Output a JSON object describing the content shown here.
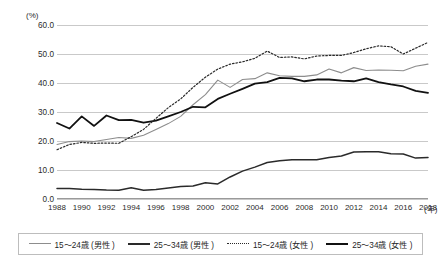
{
  "chart_data": {
    "type": "line",
    "title": "",
    "xlabel": "(年)",
    "ylabel": "(%)",
    "ylim": [
      0.0,
      60.0
    ],
    "yticks": [
      "0.0",
      "10.0",
      "20.0",
      "30.0",
      "40.0",
      "50.0",
      "60.0"
    ],
    "ytick_values": [
      0.0,
      10.0,
      20.0,
      30.0,
      40.0,
      50.0,
      60.0
    ],
    "grid": true,
    "legend_position": "bottom",
    "x": [
      1988,
      1989,
      1990,
      1991,
      1992,
      1993,
      1994,
      1995,
      1996,
      1997,
      1998,
      1999,
      2000,
      2001,
      2002,
      2003,
      2004,
      2005,
      2006,
      2007,
      2008,
      2009,
      2010,
      2011,
      2012,
      2013,
      2014,
      2015,
      2016,
      2017,
      2018
    ],
    "xtick_labels": [
      "1988",
      "1990",
      "1992",
      "1994",
      "1996",
      "1998",
      "2000",
      "2002",
      "2004",
      "2006",
      "2008",
      "2010",
      "2012",
      "2014",
      "2016",
      "2018"
    ],
    "xtick_values": [
      1988,
      1990,
      1992,
      1994,
      1996,
      1998,
      2000,
      2002,
      2004,
      2006,
      2008,
      2010,
      2012,
      2014,
      2016,
      2018
    ],
    "series": [
      {
        "name": "15～24歳 (男性 )",
        "style": "solid-thin-gray",
        "color": "#8d8d8d",
        "values": [
          18.8,
          19.8,
          20.0,
          19.8,
          20.5,
          21.2,
          20.9,
          22.0,
          24.0,
          26.0,
          28.5,
          32.5,
          36.0,
          41.0,
          38.5,
          41.2,
          41.5,
          43.5,
          42.5,
          42.3,
          42.3,
          42.8,
          44.8,
          43.5,
          45.3,
          44.3,
          44.5,
          44.4,
          44.2,
          45.8,
          46.5
        ]
      },
      {
        "name": "25～34歳 (男性 )",
        "style": "solid-thick-dark",
        "color": "#2a2a2a",
        "values": [
          3.6,
          3.6,
          3.4,
          3.3,
          3.1,
          3.0,
          3.9,
          3.0,
          3.3,
          3.8,
          4.3,
          4.5,
          5.6,
          5.2,
          7.6,
          9.6,
          11.0,
          12.6,
          13.2,
          13.5,
          13.5,
          13.5,
          14.3,
          14.8,
          16.2,
          16.3,
          16.3,
          15.6,
          15.5,
          14.1,
          14.3
        ]
      },
      {
        "name": "15～24歳 (女性 )",
        "style": "dotted-dark",
        "color": "#2a2a2a",
        "values": [
          17.0,
          18.8,
          19.5,
          19.2,
          19.3,
          19.2,
          21.5,
          24.0,
          27.8,
          31.5,
          34.5,
          38.5,
          42.0,
          44.8,
          46.5,
          47.3,
          48.5,
          51.0,
          48.8,
          49.0,
          48.3,
          49.3,
          49.5,
          49.5,
          50.5,
          51.8,
          52.8,
          52.5,
          50.0,
          52.0,
          54.0
        ]
      },
      {
        "name": "25～34歳 (女性 )",
        "style": "solid-thick-black",
        "color": "#111111",
        "values": [
          26.2,
          24.3,
          28.5,
          25.2,
          28.8,
          27.2,
          27.3,
          26.3,
          27.0,
          28.5,
          30.0,
          31.8,
          31.6,
          34.5,
          36.3,
          38.0,
          39.8,
          40.3,
          41.8,
          41.6,
          40.6,
          41.2,
          41.2,
          40.8,
          40.6,
          41.6,
          40.3,
          39.5,
          38.8,
          37.3,
          36.6
        ]
      }
    ]
  },
  "axis": {
    "y_unit": "(%)",
    "x_unit": "(年)"
  },
  "legend": {
    "items": [
      {
        "label": "15～24歳 (男性 )",
        "swatch": "line-gray-thin"
      },
      {
        "label": "25～34歳 (男性 )",
        "swatch": "line-dark-thick"
      },
      {
        "label": "15～24歳 (女性 )",
        "swatch": "line-dotted"
      },
      {
        "label": "25～34歳 (女性 )",
        "swatch": "line-black-thick"
      }
    ]
  }
}
